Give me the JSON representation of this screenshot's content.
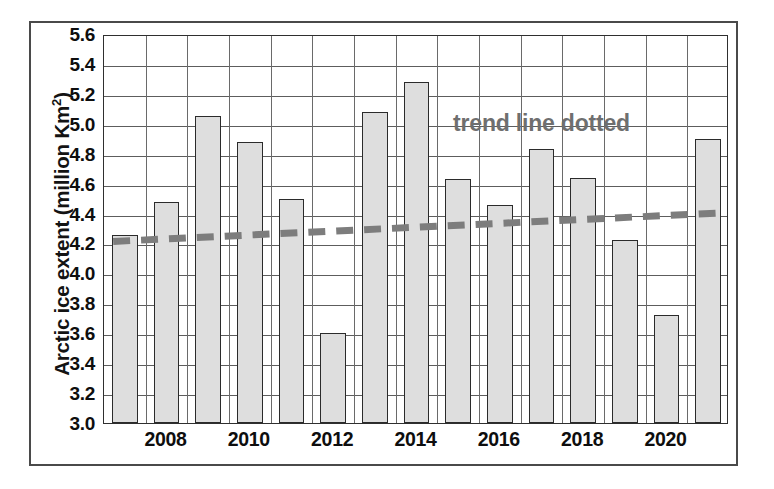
{
  "chart_data": {
    "type": "bar",
    "title": "",
    "xlabel": "",
    "ylabel": "Arctic ice extent (million Km²)",
    "ylabel_text": "Arctic ice extent (million Km",
    "ylabel_sup": "2",
    "ylabel_tail": ")",
    "categories": [
      2007,
      2008,
      2009,
      2010,
      2011,
      2012,
      2013,
      2014,
      2015,
      2016,
      2017,
      2018,
      2019,
      2020,
      2021
    ],
    "values": [
      4.26,
      4.48,
      5.05,
      4.88,
      4.5,
      3.6,
      5.08,
      5.28,
      4.63,
      4.46,
      4.83,
      4.64,
      4.22,
      3.72,
      4.9
    ],
    "series": [
      {
        "name": "Arctic ice extent",
        "type": "bar",
        "values": [
          4.26,
          4.48,
          5.05,
          4.88,
          4.5,
          3.6,
          5.08,
          5.28,
          4.63,
          4.46,
          4.83,
          4.64,
          4.22,
          3.72,
          4.9
        ]
      },
      {
        "name": "trend line dotted",
        "type": "line",
        "style": "dashed",
        "color": "#7d7d7d",
        "endpoints": [
          4.22,
          4.41
        ]
      }
    ],
    "ylim": [
      3.0,
      5.6
    ],
    "ytick_step": 0.2,
    "yticks": [
      "5.6",
      "5.4",
      "5.2",
      "5.0",
      "4.8",
      "4.6",
      "4.4",
      "4.2",
      "4.0",
      "3.8",
      "3.6",
      "3.4",
      "3.2",
      "3.0"
    ],
    "ytick_values": [
      5.6,
      5.4,
      5.2,
      5.0,
      4.8,
      4.6,
      4.4,
      4.2,
      4.0,
      3.8,
      3.6,
      3.4,
      3.2,
      3.0
    ],
    "xticks": [
      "2008",
      "2010",
      "2012",
      "2014",
      "2016",
      "2018",
      "2020"
    ],
    "xtick_values": [
      2008,
      2010,
      2012,
      2014,
      2016,
      2018,
      2020
    ],
    "grid": true,
    "grid_axis": "y",
    "legend": null,
    "annotations": [
      {
        "name": "trend-line-note",
        "text": "trend line dotted",
        "x": 2017.0,
        "y": 5.02,
        "color": "#6f6f6f"
      }
    ],
    "colors": {
      "bar_fill": "#dedede",
      "bar_stroke": "#2b2b2b",
      "trend_line": "#7d7d7d",
      "grid": "#5d5d5d",
      "axis": "#2f2f2f",
      "frame": "#4a4a4a",
      "text": "#0e0e0e",
      "annotation_text": "#6f6f6f",
      "background": "#ffffff"
    }
  }
}
